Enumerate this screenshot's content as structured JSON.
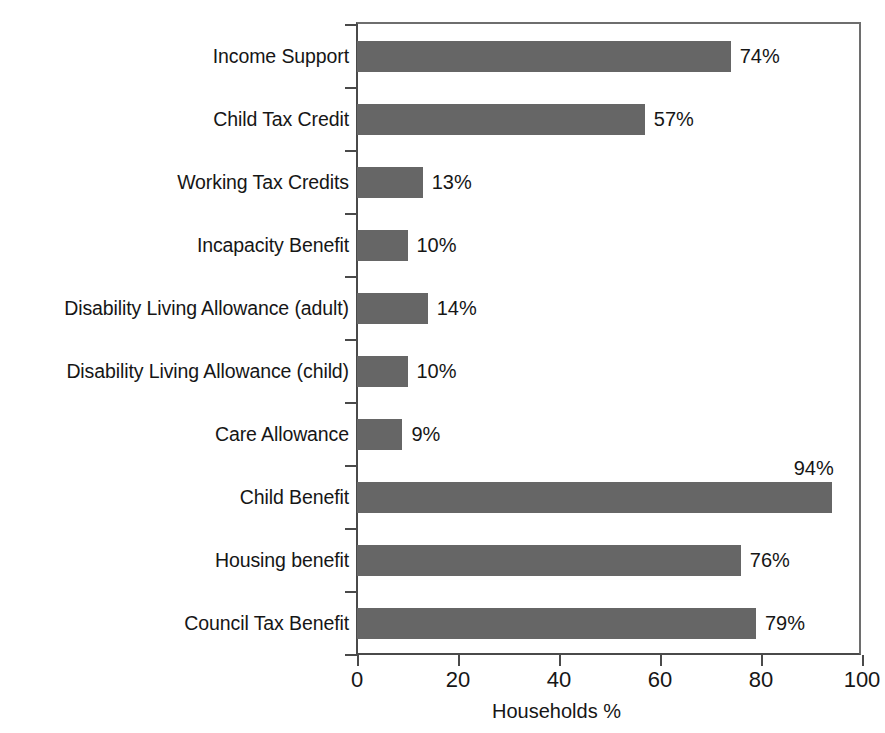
{
  "chart_data": {
    "type": "bar",
    "orientation": "horizontal",
    "title": "",
    "xlabel": "Households %",
    "ylabel": "",
    "xlim": [
      0,
      100
    ],
    "xticks": [
      "0",
      "20",
      "40",
      "60",
      "80",
      "100"
    ],
    "grid": false,
    "legend": null,
    "bar_color": "#666666",
    "axis_color": "#4a4a4a",
    "categories": [
      "Income Support",
      "Child Tax Credit",
      "Working Tax Credits",
      "Incapacity Benefit",
      "Disability Living Allowance (adult)",
      "Disability Living Allowance (child)",
      "Care Allowance",
      "Child Benefit",
      "Housing benefit",
      "Council Tax Benefit"
    ],
    "values": [
      74,
      57,
      13,
      10,
      14,
      10,
      9,
      94,
      76,
      79
    ],
    "value_labels": [
      "74%",
      "57%",
      "13%",
      "10%",
      "14%",
      "10%",
      "9%",
      "94%",
      "76%",
      "79%"
    ],
    "label_position": [
      "right",
      "right",
      "right",
      "right",
      "right",
      "right",
      "right",
      "above-right",
      "right",
      "right"
    ]
  }
}
